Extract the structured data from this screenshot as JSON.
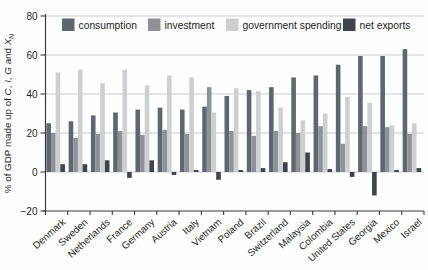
{
  "chart_data": {
    "type": "bar",
    "title": "",
    "ylabel_parts": [
      {
        "text": "% of GDP made up of ",
        "style": "normal"
      },
      {
        "text": "C",
        "style": "italic"
      },
      {
        "text": ", ",
        "style": "normal"
      },
      {
        "text": "I",
        "style": "italic"
      },
      {
        "text": ", ",
        "style": "normal"
      },
      {
        "text": "G",
        "style": "italic"
      },
      {
        "text": " and ",
        "style": "normal"
      },
      {
        "text": "X",
        "style": "italic"
      },
      {
        "text": "N",
        "style": "sub"
      }
    ],
    "xlabel": "",
    "ylim": [
      -20,
      80
    ],
    "yticks": [
      -20,
      0,
      20,
      40,
      60,
      80
    ],
    "grid": true,
    "legend_position": "top",
    "categories": [
      "Denmark",
      "Sweden",
      "Netherlands",
      "France",
      "Germany",
      "Austria",
      "Italy",
      "Vietnam",
      "Poland",
      "Brazil",
      "Switzerland",
      "Malaysia",
      "Colombia",
      "United States",
      "Georgia",
      "Mexico",
      "Israel"
    ],
    "series": [
      {
        "name": "consumption",
        "color": "#5d6770",
        "values": [
          25,
          26,
          29,
          30.5,
          32,
          33,
          32,
          33.5,
          39,
          42,
          43.5,
          48.5,
          49.5,
          55,
          59.5,
          59.5,
          63
        ]
      },
      {
        "name": "investment",
        "color": "#8e9297",
        "values": [
          20,
          17.5,
          19.5,
          21,
          19,
          21.5,
          19.5,
          43.5,
          21,
          18.5,
          21,
          20,
          23.5,
          14.5,
          23.5,
          23,
          19.5
        ]
      },
      {
        "name": "government spending",
        "color": "#cdcfd1",
        "values": [
          51,
          52.5,
          45.5,
          52.5,
          44.5,
          49.5,
          48.5,
          30.5,
          43,
          41.5,
          33,
          26.5,
          30,
          38.5,
          35.5,
          24,
          25
        ]
      },
      {
        "name": "net exports",
        "color": "#3d444b",
        "values": [
          4,
          4,
          6,
          -3,
          6,
          -1.5,
          1,
          -4,
          1,
          2,
          5,
          10,
          1.5,
          -2.5,
          -12,
          1,
          2
        ]
      }
    ],
    "style": {
      "grid_color": "#c9cbcd",
      "axis_color": "#3b3b3b",
      "text_color": "#231f20",
      "background": "#fefefe"
    }
  }
}
